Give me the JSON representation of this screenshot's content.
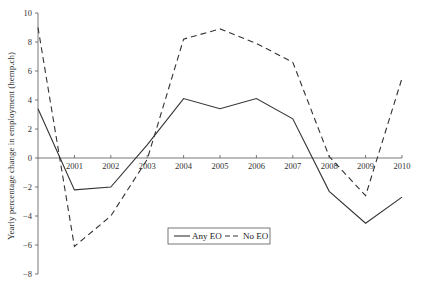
{
  "chart_data": {
    "type": "line",
    "title": "",
    "xlabel": "",
    "ylabel": "Yearly percentage change in employment (hemp.ch)",
    "x": [
      2000,
      2001,
      2002,
      2003,
      2004,
      2005,
      2006,
      2007,
      2008,
      2009,
      2010
    ],
    "x_tick_labels": [
      "2001",
      "2002",
      "2003",
      "2004",
      "2005",
      "2006",
      "2007",
      "2008",
      "2009",
      "2010"
    ],
    "y_ticks": [
      10,
      8,
      6,
      4,
      2,
      0,
      -2,
      -4,
      -6,
      -8
    ],
    "ylim": [
      -8,
      10
    ],
    "grid": false,
    "legend_position": "bottom-center-inside",
    "series": [
      {
        "name": "Any EO",
        "style": "solid",
        "color": "#333333",
        "values": [
          3.4,
          -2.2,
          -2.0,
          0.9,
          4.1,
          3.4,
          4.1,
          2.7,
          -2.3,
          -4.5,
          -2.7
        ]
      },
      {
        "name": "No EO",
        "style": "dashed",
        "color": "#333333",
        "values": [
          9.0,
          -6.1,
          -4.0,
          -0.1,
          8.2,
          8.9,
          7.9,
          6.6,
          0.1,
          -2.6,
          5.5
        ]
      }
    ]
  }
}
